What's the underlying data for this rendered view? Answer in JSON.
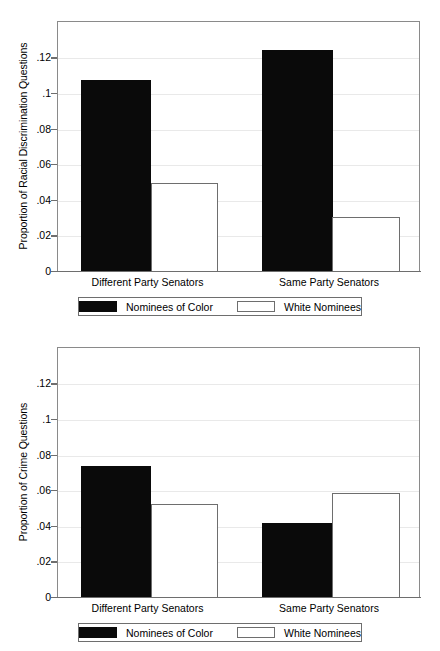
{
  "figure": {
    "background_color": "#ffffff",
    "bar_dark_color": "#0a0a0a",
    "bar_light_color": "#ffffff",
    "frame_color": "#8a8a8a",
    "grid_color": "#e9e9e9"
  },
  "legend": {
    "series": [
      {
        "key": "nominees_of_color",
        "label": "Nominees of Color",
        "swatch": "black-filled-swatch"
      },
      {
        "key": "white_nominees",
        "label": "White Nominees",
        "swatch": "white-outline-swatch"
      }
    ]
  },
  "chart_data": [
    {
      "id": "racial-discrimination-chart",
      "type": "bar",
      "title": "",
      "xlabel": "",
      "ylabel": "Proportion of Racial Discrimination Questions",
      "categories": [
        "Different Party Senators",
        "Same Party Senators"
      ],
      "series": [
        {
          "name": "Nominees of Color",
          "values": [
            0.108,
            0.125
          ]
        },
        {
          "name": "White Nominees",
          "values": [
            0.05,
            0.031
          ]
        }
      ],
      "ylim": [
        0,
        0.1405
      ],
      "yticks": [
        0,
        0.02,
        0.04,
        0.06,
        0.08,
        0.1,
        0.12
      ],
      "ytick_labels": [
        "0",
        ".02",
        ".04",
        ".06",
        ".08",
        ".1",
        ".12"
      ],
      "grid": true,
      "legend_position": "below-axis"
    },
    {
      "id": "crime-questions-chart",
      "type": "bar",
      "title": "",
      "xlabel": "",
      "ylabel": "Proportion of Crime Questions",
      "categories": [
        "Different Party Senators",
        "Same Party Senators"
      ],
      "series": [
        {
          "name": "Nominees of Color",
          "values": [
            0.074,
            0.042
          ]
        },
        {
          "name": "White Nominees",
          "values": [
            0.053,
            0.059
          ]
        }
      ],
      "ylim": [
        0,
        0.1405
      ],
      "yticks": [
        0,
        0.02,
        0.04,
        0.06,
        0.08,
        0.1,
        0.12
      ],
      "ytick_labels": [
        "0",
        ".02",
        ".04",
        ".06",
        ".08",
        ".1",
        ".12"
      ],
      "grid": true,
      "legend_position": "below-axis"
    }
  ]
}
